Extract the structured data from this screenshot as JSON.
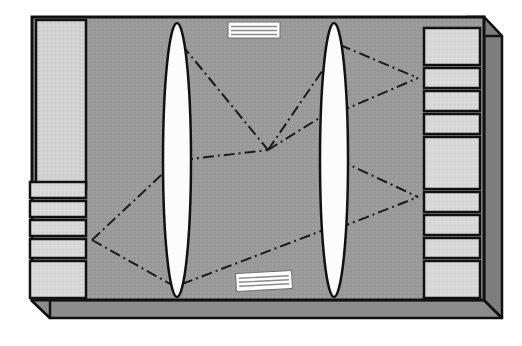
{
  "figure": {
    "canvas": {
      "width": 522,
      "height": 346
    },
    "background_color": "#ffffff"
  },
  "colors": {
    "outline": "#111111",
    "main_panel": "#9a9a9a",
    "side_bevel": "#7d7d7d",
    "bottom_bevel": "#8c8c8c",
    "left_sidebar": "#d2d2d2",
    "block_fill": "#d8d8d8",
    "lens_fill": "#fcfcfc",
    "label_fill": "#ffffff",
    "ray_color": "#1a1a1a"
  },
  "enclosure": {
    "name": "isometric-housing",
    "front_face": {
      "label": "front-face",
      "points": "32,17 484,17 484,300 32,300",
      "fill_ref": "main_panel"
    },
    "right_bevel": {
      "label": "right-bevel",
      "points": "484,17 502,36 502,318 484,300",
      "fill_ref": "side_bevel"
    },
    "top_right_chamfer": {
      "label": "top-right-chamfer",
      "points": "467,17 484,17 502,36 484,36"
    },
    "bottom_bevel": {
      "label": "bottom-bevel",
      "points": "32,300 484,300 502,318 50,318"
    },
    "bottom_left_chamfer": {
      "label": "bottom-left-chamfer",
      "points": "32,282 32,300 50,318 50,300"
    }
  },
  "left_sidebar": {
    "name": "left-sidebar-panel",
    "label": "left light panel",
    "x": 36,
    "y": 20,
    "width": 50,
    "height": 170
  },
  "left_blocks": {
    "name": "left-block-stack",
    "label": "left stacked modules",
    "count": 5,
    "x": 30,
    "width": 56,
    "items": [
      {
        "id": "left-block-1",
        "y": 182,
        "height": 16
      },
      {
        "id": "left-block-2",
        "y": 201,
        "height": 16
      },
      {
        "id": "left-block-3",
        "y": 220,
        "height": 16
      },
      {
        "id": "left-block-4",
        "y": 239,
        "height": 19
      },
      {
        "id": "left-block-5",
        "y": 261,
        "height": 37
      }
    ]
  },
  "right_blocks": {
    "name": "right-block-stack",
    "label": "right stacked modules",
    "count": 9,
    "x": 424,
    "width": 56,
    "items": [
      {
        "id": "right-block-1",
        "y": 28,
        "height": 37
      },
      {
        "id": "right-block-2",
        "y": 68,
        "height": 20
      },
      {
        "id": "right-block-3",
        "y": 91,
        "height": 20
      },
      {
        "id": "right-block-4",
        "y": 114,
        "height": 20
      },
      {
        "id": "right-block-5",
        "y": 137,
        "height": 52
      },
      {
        "id": "right-block-6",
        "y": 192,
        "height": 20
      },
      {
        "id": "right-block-7",
        "y": 215,
        "height": 20
      },
      {
        "id": "right-block-8",
        "y": 238,
        "height": 20
      },
      {
        "id": "right-block-9",
        "y": 261,
        "height": 37
      }
    ]
  },
  "lenses": [
    {
      "id": "lens-1",
      "name": "lens-left",
      "label": "left converging lens",
      "cx": 177,
      "cy": 160,
      "rx": 14,
      "ry": 137
    },
    {
      "id": "lens-2",
      "name": "lens-right",
      "label": "right converging lens",
      "cx": 334,
      "cy": 160,
      "rx": 14,
      "ry": 137
    }
  ],
  "labels": [
    {
      "id": "label-top",
      "name": "top-label-plate",
      "text_lines": 3,
      "x": 228,
      "y": 22,
      "width": 52,
      "height": 16,
      "rotation": 0
    },
    {
      "id": "label-bottom",
      "name": "bottom-label-plate",
      "text_lines": 3,
      "x": 236,
      "y": 272,
      "width": 56,
      "height": 18,
      "rotation": -3
    }
  ],
  "rays": {
    "name": "ray-paths",
    "style": "dash-dot",
    "dash_pattern": "11 4 2 4",
    "stroke_width": 2,
    "focal_points": [
      {
        "id": "focus-left",
        "x": 92,
        "y": 240
      },
      {
        "id": "focus-right-top",
        "x": 418,
        "y": 78
      },
      {
        "id": "focus-right-bot",
        "x": 418,
        "y": 197
      },
      {
        "id": "crossing-center",
        "x": 268,
        "y": 150
      }
    ],
    "segments": [
      {
        "id": "ray-1",
        "from": [
          92,
          240
        ],
        "to": [
          172,
          165
        ],
        "desc": "left focus up to lens-1 lower"
      },
      {
        "id": "ray-2",
        "from": [
          92,
          240
        ],
        "to": [
          172,
          285
        ],
        "desc": "left focus down to lens-1 bottom"
      },
      {
        "id": "ray-3",
        "from": [
          182,
          160
        ],
        "to": [
          268,
          150
        ],
        "desc": "lens-1 to center crossing upper"
      },
      {
        "id": "ray-4",
        "from": [
          182,
          284
        ],
        "to": [
          329,
          228
        ],
        "desc": "lens-1 bottom to lens-2 lower"
      },
      {
        "id": "ray-5",
        "from": [
          268,
          150
        ],
        "to": [
          329,
          112
        ],
        "desc": "center crossing to lens-2 mid"
      },
      {
        "id": "ray-6",
        "from": [
          268,
          150
        ],
        "to": [
          340,
          45
        ],
        "desc": "center crossing up to lens-2 top"
      },
      {
        "id": "ray-7",
        "from": [
          340,
          45
        ],
        "to": [
          418,
          78
        ],
        "desc": "lens-2 top to right focus top"
      },
      {
        "id": "ray-8",
        "from": [
          339,
          112
        ],
        "to": [
          418,
          78
        ],
        "desc": "lens-2 mid to right focus top"
      },
      {
        "id": "ray-9",
        "from": [
          339,
          160
        ],
        "to": [
          418,
          197
        ],
        "desc": "lens-2 to right focus bottom"
      },
      {
        "id": "ray-10",
        "from": [
          339,
          228
        ],
        "to": [
          418,
          197
        ],
        "desc": "lens-2 lower to right focus bottom"
      },
      {
        "id": "ray-11",
        "from": [
          182,
          45
        ],
        "to": [
          268,
          150
        ],
        "desc": "lens-1 top down to center crossing"
      }
    ]
  }
}
